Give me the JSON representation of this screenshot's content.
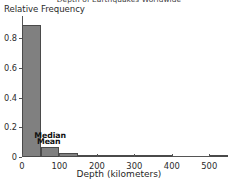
{
  "chart_data": {
    "type": "bar",
    "title": "Depth of Earthquakes Worldwide",
    "xlabel": "Depth (kilometers)",
    "ylabel": "Relative Frequency",
    "xlim": [
      0,
      550
    ],
    "ylim": [
      0,
      0.95
    ],
    "grid": false,
    "legend": null,
    "bin_width": 50,
    "bar_color": "#808080",
    "bar_edge_color": "#4a4a4a",
    "categories": [
      "0-50",
      "50-100",
      "100-150",
      "150-200",
      "200-250",
      "250-300",
      "300-350",
      "350-400",
      "400-450",
      "450-500",
      "500-550"
    ],
    "bin_starts": [
      0,
      50,
      100,
      150,
      200,
      250,
      300,
      350,
      400,
      450,
      500
    ],
    "values": [
      0.89,
      0.07,
      0.03,
      0.01,
      0.004,
      0.003,
      0.003,
      0.003,
      0.0,
      0.0,
      0.01
    ],
    "xticks": [
      0,
      100,
      200,
      300,
      400,
      500
    ],
    "xtick_labels": [
      "0",
      "100",
      "200",
      "300",
      "400",
      "500"
    ],
    "yticks": [
      0,
      0.2,
      0.4,
      0.6,
      0.8
    ],
    "ytick_labels": [
      "0",
      "0.2",
      "0.4",
      "0.6",
      "0.8"
    ],
    "annotations": [
      {
        "name": "median",
        "label": "Median",
        "x": 33,
        "y": 0.175
      },
      {
        "name": "mean",
        "label": "Mean",
        "x": 40,
        "y": 0.135
      }
    ]
  }
}
